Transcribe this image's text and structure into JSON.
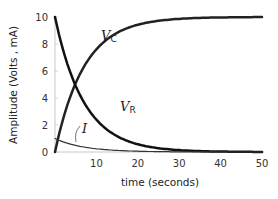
{
  "chart_data": {
    "type": "line",
    "title": "",
    "xlabel": "time (seconds)",
    "ylabel": "Amplitude (Volts , mA)",
    "xlim": [
      0,
      50
    ],
    "ylim": [
      0,
      10
    ],
    "x_ticks": [
      10,
      20,
      30,
      40,
      50
    ],
    "y_ticks": [
      0,
      2,
      4,
      6,
      8,
      10
    ],
    "grid": false,
    "legend": "inline labels",
    "x": [
      0,
      2,
      4,
      6,
      8,
      10,
      15,
      20,
      25,
      30,
      35,
      40,
      45,
      50
    ],
    "series": [
      {
        "name": "VC",
        "label_main": "V",
        "label_sub": "C",
        "color": "#222222",
        "line_width": 2.5,
        "values": [
          0,
          2.5,
          4.4,
          5.8,
          6.8,
          7.6,
          8.8,
          9.4,
          9.7,
          9.85,
          9.92,
          9.96,
          9.98,
          9.99
        ]
      },
      {
        "name": "VR",
        "label_main": "V",
        "label_sub": "R",
        "color": "#111111",
        "line_width": 2.5,
        "values": [
          10,
          7.5,
          5.6,
          4.2,
          3.2,
          2.4,
          1.2,
          0.6,
          0.3,
          0.15,
          0.08,
          0.04,
          0.02,
          0.01
        ]
      },
      {
        "name": "I",
        "label_main": "I",
        "label_sub": "",
        "color": "#333333",
        "line_width": 1.2,
        "values": [
          1.0,
          0.75,
          0.56,
          0.42,
          0.32,
          0.24,
          0.12,
          0.06,
          0.03,
          0.015,
          0.008,
          0.004,
          0.002,
          0.001
        ]
      }
    ],
    "time_constant_estimate": 7
  }
}
